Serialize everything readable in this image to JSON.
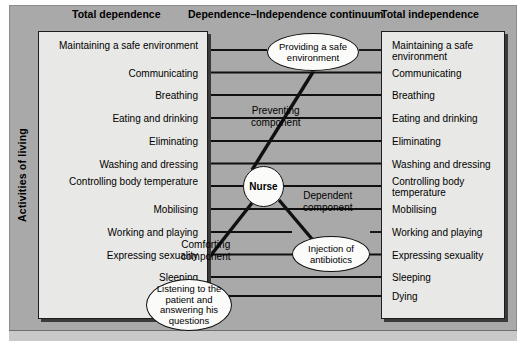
{
  "figure": {
    "vertical_axis_label": "Activities of living",
    "headers": {
      "left": "Total dependence",
      "middle": "Dependence–Independence continuum",
      "right": "Total independence"
    }
  },
  "activities_of_living": [
    "Maintaining a safe environment",
    "Communicating",
    "Breathing",
    "Eating and drinking",
    "Eliminating",
    "Washing and dressing",
    "Controlling body temperature",
    "Mobilising",
    "Working and playing",
    "Expressing sexuality",
    "Sleeping",
    "Dying"
  ],
  "left_column": {
    "title": "Total dependence",
    "items": [
      "Maintaining a safe environment",
      "Communicating",
      "Breathing",
      "Eating and drinking",
      "Eliminating",
      "Washing and dressing",
      "Controlling body temperature",
      "Mobilising",
      "Working and playing",
      "Expressing sexuality",
      "Sleeping",
      "Dying"
    ]
  },
  "right_column": {
    "title": "Total independence",
    "items": [
      "Maintaining a safe environment",
      "Communicating",
      "Breathing",
      "Eating and drinking",
      "Eliminating",
      "Washing and dressing",
      "Controlling body temperature",
      "Mobilising",
      "Working and playing",
      "Expressing sexuality",
      "Sleeping",
      "Dying"
    ]
  },
  "nodes": {
    "nurse": "Nurse",
    "providing_safe_environment": "Providing a safe environment",
    "injection_of_antibiotics": "Injection of antibiotics",
    "listening": "Listening to the patient and answering his questions"
  },
  "captions": {
    "preventing": "Preventing component",
    "dependent": "Dependent component",
    "comforting": "Comforting component"
  },
  "colors": {
    "panel_background": "#a9a9a9",
    "box_fill": "#e8e8e6",
    "node_fill": "#fbfbf9",
    "stroke": "#101010",
    "text": "#000000"
  }
}
